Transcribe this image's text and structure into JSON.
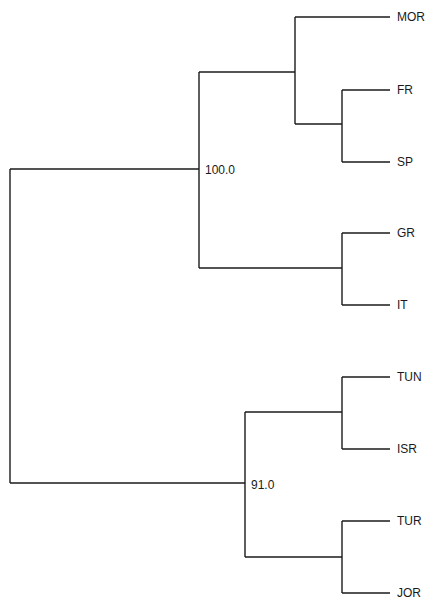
{
  "tree": {
    "type": "dendrogram",
    "orientation": "horizontal",
    "nodes": {
      "upper_cluster": {
        "support": "100.0"
      },
      "lower_cluster": {
        "support": "91.0"
      }
    },
    "leaves": [
      "MOR",
      "FR",
      "SP",
      "GR",
      "IT",
      "TUN",
      "ISR",
      "TUR",
      "JOR"
    ],
    "structure": "((MOR,(FR,SP)),(GR,IT))100.0,((TUN,ISR),(TUR,JOR))91.0",
    "line_color": "#1a1a1a"
  }
}
